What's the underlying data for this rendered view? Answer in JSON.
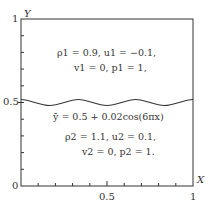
{
  "axes": {
    "y_label": "Y",
    "x_label": "X",
    "y_ticks": [
      "1",
      "0.5",
      "0"
    ],
    "x_ticks": [
      "0.5",
      "1"
    ]
  },
  "upper_region": {
    "line1": "ρ1 = 0.9,  u1 = −0.1,",
    "line2": "v1 = 0,  p1 = 1,"
  },
  "interface": {
    "equation": "ȳ = 0.5 + 0.02cos(6πx)"
  },
  "lower_region": {
    "line1": "ρ2 = 1.1,  u2 = 0.1,",
    "line2": "v2 = 0,  p2 = 1."
  },
  "colors": {
    "line": "#333333",
    "background": "#ffffff"
  }
}
